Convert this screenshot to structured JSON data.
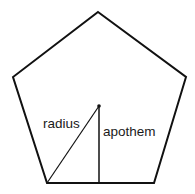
{
  "diagram": {
    "shape": "regular pentagon",
    "labels": {
      "radius": "radius",
      "apothem": "apothem"
    },
    "colors": {
      "stroke": "#111111",
      "background": "#ffffff"
    }
  }
}
